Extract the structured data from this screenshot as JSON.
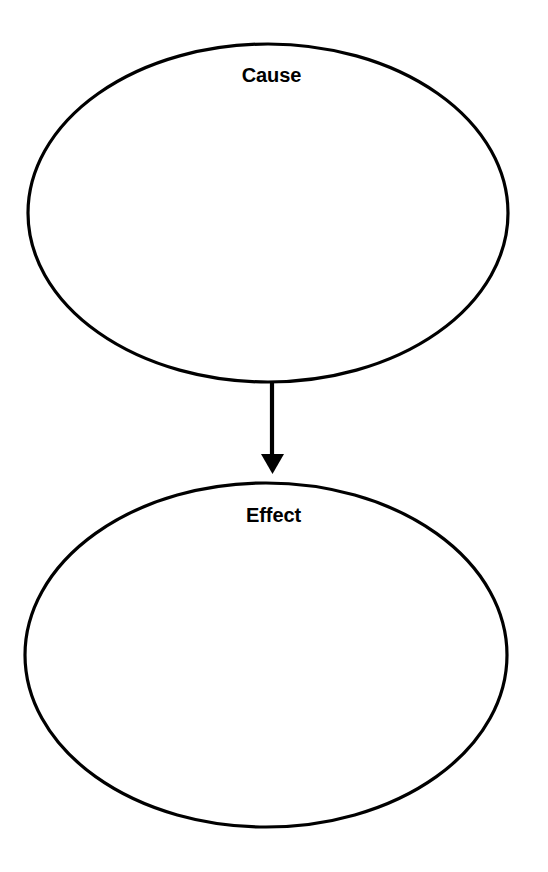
{
  "page": {
    "width": 548,
    "height": 872,
    "background_color": "#ffffff",
    "title": "Cause and Effect",
    "title_visible": "partially cropped at top edge"
  },
  "diagram": {
    "type": "cause-and-effect-graphic-organizer",
    "stroke_color": "#000000",
    "fill_color": "#ffffff",
    "stroke_width": 3,
    "nodes": [
      {
        "id": "cause",
        "label": "Cause",
        "shape": "ellipse",
        "center_x": 268,
        "center_y": 213,
        "radius_x": 240,
        "radius_y": 169,
        "content": "",
        "placeholder": ""
      },
      {
        "id": "effect",
        "label": "Effect",
        "shape": "ellipse",
        "center_x": 266,
        "center_y": 655,
        "radius_x": 241,
        "radius_y": 172,
        "content": "",
        "placeholder": ""
      }
    ],
    "connector": {
      "id": "cause-to-effect-arrow",
      "from": "cause",
      "to": "effect",
      "direction": "down",
      "shaft_x": 272,
      "shaft_top_y": 383,
      "shaft_bottom_y": 457,
      "head_left_x": 261,
      "head_right_x": 284,
      "head_tip_y": 473,
      "color": "#000000"
    }
  }
}
